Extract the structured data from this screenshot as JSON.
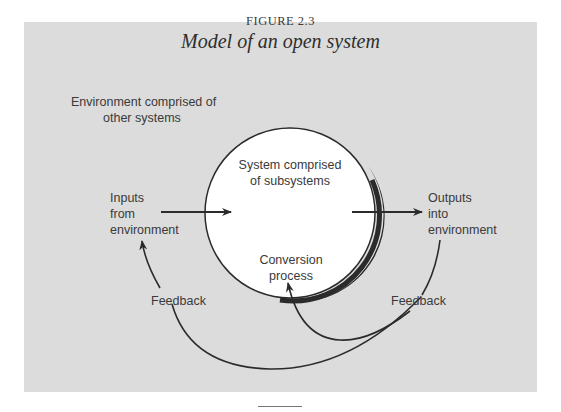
{
  "figure": {
    "number": "FIGURE 2.3",
    "title": "Model of an open system"
  },
  "labels": {
    "environment_line1": "Environment comprised of",
    "environment_line2": "other systems",
    "system_line1": "System comprised",
    "system_line2": "of subsystems",
    "conversion_line1": "Conversion",
    "conversion_line2": "process",
    "inputs_line1": "Inputs",
    "inputs_line2": "from",
    "inputs_line3": "environment",
    "outputs_line1": "Outputs",
    "outputs_line2": "into",
    "outputs_line3": "environment",
    "feedback_left": "Feedback",
    "feedback_right": "Feedback"
  },
  "colors": {
    "panel_background": "#dcdcdc",
    "circle_fill": "#ffffff",
    "stroke": "#2b2b2b"
  }
}
